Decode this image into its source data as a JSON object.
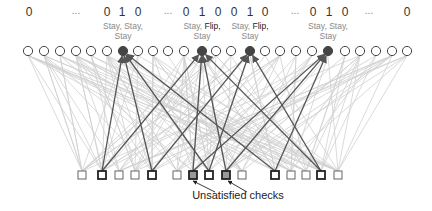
{
  "diagram": {
    "colors": {
      "background": "#ffffff",
      "light_edge": "#d0d0d0",
      "dark_edge": "#555555",
      "variable_stroke": "#444444",
      "variable_fill": "#ffffff",
      "selected_variable_fill": "#444444",
      "check_stroke": "#555555",
      "bold_check_stroke": "#222222",
      "unsatisfied_check_fill": "#999999",
      "text": "#333333",
      "action_text": "#888888",
      "flip_text": "#222222"
    },
    "bit_labels": [
      {
        "x": 29,
        "text": "0"
      },
      {
        "x": 76,
        "text": "..."
      },
      {
        "x": 107,
        "text": "0"
      },
      {
        "x": 122,
        "text": "1"
      },
      {
        "x": 138,
        "text": "0"
      },
      {
        "x": 168,
        "text": "..."
      },
      {
        "x": 186,
        "text": "0"
      },
      {
        "x": 202,
        "text": "1"
      },
      {
        "x": 218,
        "text": "0"
      },
      {
        "x": 234,
        "text": "0"
      },
      {
        "x": 250,
        "text": "1"
      },
      {
        "x": 265,
        "text": "0"
      },
      {
        "x": 295,
        "text": "..."
      },
      {
        "x": 313,
        "text": "0"
      },
      {
        "x": 329,
        "text": "1"
      },
      {
        "x": 345,
        "text": "0"
      },
      {
        "x": 369,
        "text": "..."
      },
      {
        "x": 407,
        "text": "0"
      }
    ],
    "action_groups": [
      {
        "x": 123,
        "line1": [
          {
            "text": "Stay, ",
            "flip": false
          },
          {
            "text": "Stay,",
            "flip": false
          }
        ],
        "line2": "Stay"
      },
      {
        "x": 202,
        "line1": [
          {
            "text": "Stay, ",
            "flip": false
          },
          {
            "text": "Flip,",
            "flip": true
          }
        ],
        "line2": "Stay"
      },
      {
        "x": 250,
        "line1": [
          {
            "text": "Stay, ",
            "flip": false
          },
          {
            "text": "Flip,",
            "flip": true
          }
        ],
        "line2": "Stay"
      },
      {
        "x": 328,
        "line1": [
          {
            "text": "Stay, ",
            "flip": false
          },
          {
            "text": "Stay,",
            "flip": false
          }
        ],
        "line2": "Stay"
      }
    ],
    "variable_nodes": {
      "y": 51,
      "r": 4.6,
      "x": [
        28,
        44,
        60,
        76,
        91,
        107,
        123,
        138,
        153,
        168,
        184,
        202,
        216,
        231,
        250,
        265,
        280,
        296,
        312,
        328,
        345,
        360,
        376,
        392,
        407
      ],
      "selected": [
        6,
        11,
        14,
        19
      ]
    },
    "check_nodes": {
      "y": 175,
      "size": 8,
      "x": [
        82,
        102,
        119,
        135,
        152,
        177,
        193,
        209,
        226,
        242,
        275,
        291,
        306,
        321,
        338
      ],
      "bold": [
        1,
        4,
        7,
        10,
        13
      ],
      "unsatisfied": [
        6,
        8
      ]
    },
    "dark_edges": [
      [
        1,
        6
      ],
      [
        1,
        11
      ],
      [
        4,
        6
      ],
      [
        4,
        14
      ],
      [
        6,
        11
      ],
      [
        6,
        19
      ],
      [
        7,
        6
      ],
      [
        7,
        14
      ],
      [
        8,
        11
      ],
      [
        8,
        19
      ],
      [
        10,
        6
      ],
      [
        10,
        19
      ],
      [
        13,
        11
      ],
      [
        13,
        14
      ]
    ],
    "unsatisfied_arrows": [
      {
        "from": [
          215,
          192
        ],
        "to": [
          193,
          181
        ]
      },
      {
        "from": [
          247,
          192
        ],
        "to": [
          228,
          181
        ]
      }
    ],
    "caption": {
      "text": "Unsatisfied checks",
      "x": 238,
      "y": 199
    }
  }
}
